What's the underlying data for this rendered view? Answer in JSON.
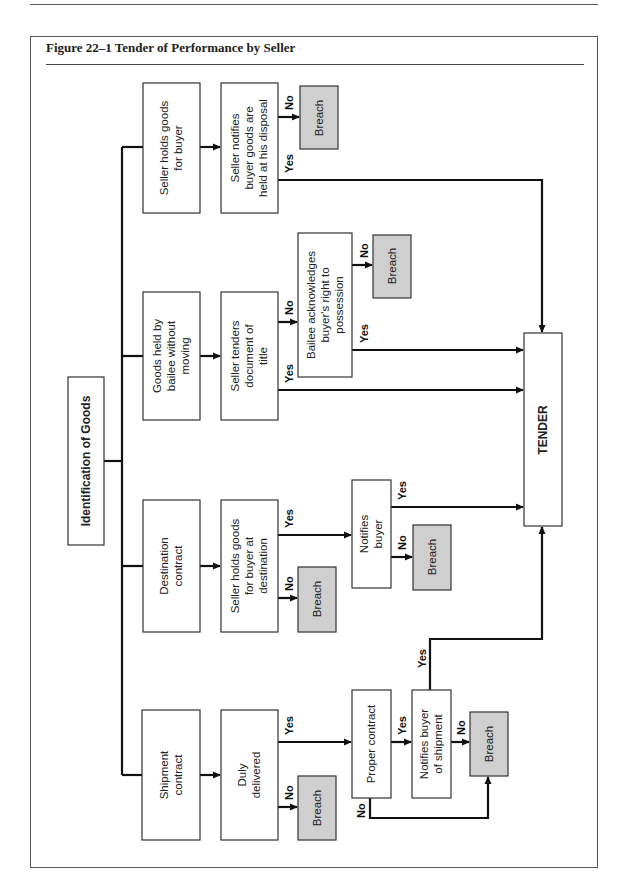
{
  "figure": {
    "title": "Figure 22–1 Tender of Performance by Seller"
  },
  "nodes": {
    "root": {
      "lines": [
        "Identification of Goods"
      ]
    },
    "seller_holds": {
      "lines": [
        "Seller holds goods",
        "for buyer"
      ]
    },
    "seller_notifies": {
      "lines": [
        "Seller notifies",
        "buyer goods are",
        "held at his disposal"
      ]
    },
    "breach_1": {
      "lines": [
        "Breach"
      ]
    },
    "bailee": {
      "lines": [
        "Goods held by",
        "bailee without",
        "moving"
      ]
    },
    "seller_tenders": {
      "lines": [
        "Seller tenders",
        "document of",
        "title"
      ]
    },
    "bailee_ack": {
      "lines": [
        "Bailee acknowledges",
        "buyer's right to",
        "possession"
      ]
    },
    "breach_2": {
      "lines": [
        "Breach"
      ]
    },
    "destination": {
      "lines": [
        "Destination",
        "contract"
      ]
    },
    "seller_holds_dest": {
      "lines": [
        "Seller holds goods",
        "for buyer at",
        "destination"
      ]
    },
    "breach_3": {
      "lines": [
        "Breach"
      ]
    },
    "notifies_buyer": {
      "lines": [
        "Notifies",
        "buyer"
      ]
    },
    "breach_4": {
      "lines": [
        "Breach"
      ]
    },
    "shipment": {
      "lines": [
        "Shipment",
        "contract"
      ]
    },
    "duly_delivered": {
      "lines": [
        "Duly",
        "delivered"
      ]
    },
    "breach_5": {
      "lines": [
        "Breach"
      ]
    },
    "proper_contract": {
      "lines": [
        "Proper contract"
      ]
    },
    "notifies_shipment": {
      "lines": [
        "Notifies buyer",
        "of shipment"
      ]
    },
    "breach_6": {
      "lines": [
        "Breach"
      ]
    },
    "tender": {
      "lines": [
        "TENDER"
      ]
    }
  },
  "labels": {
    "yes": "Yes",
    "no": "No"
  }
}
